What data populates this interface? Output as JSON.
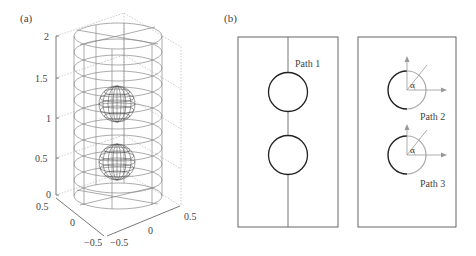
{
  "panel_a": {
    "label": "(a)",
    "z_ticks": [
      "0",
      "0.5",
      "1",
      "1.5",
      "2"
    ],
    "x_ticks": [
      "0.5",
      "0",
      "−0.5"
    ],
    "y_ticks": [
      "−0.5",
      "0",
      "0.5"
    ],
    "description": "Wireframe cylinder (radius 0.5, height 2) containing two wireframe spheres stacked vertically"
  },
  "panel_b": {
    "label": "(b)",
    "left_box": {
      "path_label": "Path 1"
    },
    "right_box": {
      "path2_label": "Path 2",
      "path3_label": "Path 3",
      "angle_symbol": "α"
    }
  },
  "colors": {
    "line_dark": "#2a2a2a",
    "line_gray": "#8a8a8a",
    "line_light": "#b0b0b0",
    "text": "#444444"
  }
}
